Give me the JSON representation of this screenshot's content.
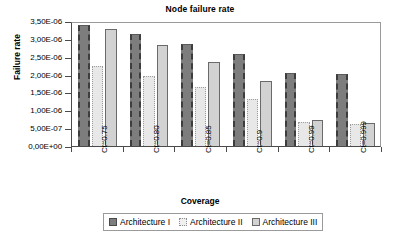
{
  "chart_data": {
    "type": "bar",
    "title": "Node failure rate",
    "xlabel": "Coverage",
    "ylabel": "Failure rate",
    "categories": [
      "Ct=0.75",
      "Ct=0.80",
      "Ct=0.85",
      "Ct=0.9",
      "Ct=0.99",
      "Ct=0.999"
    ],
    "series": [
      {
        "name": "Architecture I",
        "values": [
          3.4e-06,
          3.13e-06,
          2.86e-06,
          2.58e-06,
          2.05e-06,
          2.02e-06
        ]
      },
      {
        "name": "Architecture II",
        "values": [
          2.25e-06,
          1.96e-06,
          1.64e-06,
          1.32e-06,
          6.7e-07,
          6.2e-07
        ]
      },
      {
        "name": "Architecture III",
        "values": [
          3.28e-06,
          2.83e-06,
          2.34e-06,
          1.82e-06,
          7.4e-07,
          6.5e-07
        ]
      }
    ],
    "ylim": [
      0,
      3.5e-06
    ],
    "ytick_values": [
      0,
      5e-07,
      1e-06,
      1.5e-06,
      2e-06,
      2.5e-06,
      3e-06,
      3.5e-06
    ],
    "ytick_labels": [
      "0,00E+00",
      "5,00E-07",
      "1,00E-06",
      "1,50E-06",
      "2,00E-06",
      "2,50E-06",
      "3,00E-06",
      "3,50E-06"
    ],
    "grid": false,
    "legend_position": "bottom",
    "series_colors": [
      "#7d7d7d",
      "#e8e8e8",
      "#d2d2d2"
    ]
  }
}
